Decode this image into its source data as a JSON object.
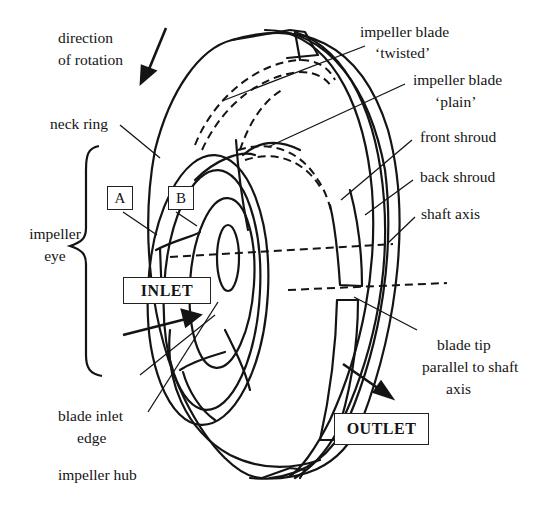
{
  "figure": {
    "labels": {
      "direction_of_rotation_1": "direction",
      "direction_of_rotation_2": "of rotation",
      "neck_ring": "neck ring",
      "impeller_eye_1": "impeller",
      "impeller_eye_2": "eye",
      "blade_twisted_1": "impeller blade",
      "blade_twisted_2": "‘twisted’",
      "blade_plain_1": "impeller blade",
      "blade_plain_2": "‘plain’",
      "front_shroud": "front shroud",
      "back_shroud": "back shroud",
      "shaft_axis": "shaft axis",
      "blade_tip_1": "blade tip",
      "blade_tip_2": "parallel to shaft",
      "blade_tip_3": "axis",
      "blade_inlet_edge_1": "blade inlet",
      "blade_inlet_edge_2": "edge",
      "impeller_hub": "impeller hub"
    },
    "boxes": {
      "a": "A",
      "b": "B",
      "inlet": "INLET",
      "outlet": "OUTLET"
    },
    "colors": {
      "line": "#141414",
      "background": "#ffffff"
    }
  }
}
